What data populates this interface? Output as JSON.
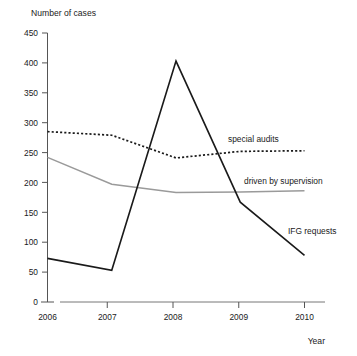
{
  "chart_data": {
    "type": "line",
    "title": "",
    "subtitle": "",
    "xlabel": "Year",
    "ylabel": "Number of cases",
    "categories": [
      "2006",
      "2007",
      "2008",
      "2009",
      "2010"
    ],
    "x": [
      2006,
      2007,
      2008,
      2009,
      2010
    ],
    "xlim": [
      2006,
      2010
    ],
    "ylim": [
      0,
      450
    ],
    "yticks": [
      0,
      50,
      100,
      150,
      200,
      250,
      300,
      350,
      400,
      450
    ],
    "ytick_labels": [
      "0",
      "50",
      "100",
      "150",
      "200",
      "250",
      "300",
      "350",
      "400",
      "450"
    ],
    "xticks": [
      2006,
      2007,
      2008,
      2009,
      2010
    ],
    "xtick_labels": [
      "2006",
      "2007",
      "2008",
      "2009",
      "2010"
    ],
    "grid": false,
    "legend_position": "inline-right-annotations",
    "series": [
      {
        "name": "special audits",
        "style": "dotted",
        "color": "#1a1a1a",
        "values": [
          285,
          279,
          241,
          252,
          253
        ]
      },
      {
        "name": "driven by supervision",
        "style": "solid",
        "color": "#9a9a9a",
        "values": [
          242,
          197,
          183,
          184,
          186
        ]
      },
      {
        "name": "IFG requests",
        "style": "solid",
        "color": "#1a1a1a",
        "values": [
          73,
          53,
          403,
          167,
          78
        ]
      }
    ],
    "annotations": [
      {
        "text": "special audits",
        "series": "special audits"
      },
      {
        "text": "driven by supervision",
        "series": "driven by supervision"
      },
      {
        "text": "IFG requests",
        "series": "IFG requests"
      }
    ]
  }
}
